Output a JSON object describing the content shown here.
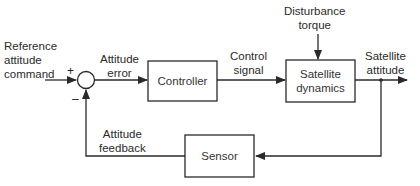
{
  "diagram": {
    "type": "feedback-control-block-diagram",
    "blocks": [
      {
        "id": "controller",
        "label": "Controller"
      },
      {
        "id": "satellite_dynamics",
        "label_line1": "Satellite",
        "label_line2": "dynamics"
      },
      {
        "id": "sensor",
        "label": "Sensor"
      }
    ],
    "summing_junction": {
      "plus": "+",
      "minus": "–"
    },
    "signals": {
      "reference": {
        "line1": "Reference",
        "line2": "attitude",
        "line3": "command"
      },
      "error": {
        "line1": "Attitude",
        "line2": "error"
      },
      "control": {
        "line1": "Control",
        "line2": "signal"
      },
      "disturbance": {
        "line1": "Disturbance",
        "line2": "torque"
      },
      "output": {
        "line1": "Satellite",
        "line2": "attitude"
      },
      "feedback": {
        "line1": "Attitude",
        "line2": "feedback"
      }
    },
    "colors": {
      "line": "#2a2a2a",
      "background": "#ffffff"
    }
  }
}
